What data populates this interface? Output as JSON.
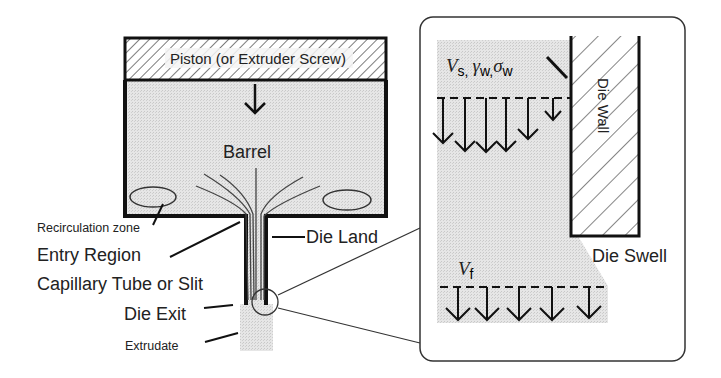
{
  "diagram": {
    "main": {
      "piston_label": "Piston (or Extruder Screw)",
      "barrel_label": "Barrel",
      "recirculation_label": "Recirculation zone",
      "entry_region_label": "Entry Region",
      "capillary_label": "Capillary Tube or Slit",
      "die_land_label": "Die Land",
      "die_exit_label": "Die Exit",
      "extrudate_label": "Extrudate"
    },
    "inset": {
      "wall_velocity_symbol": "V",
      "wall_velocity_sub": "s,",
      "shear_rate_symbol": "γ",
      "shear_rate_sub": "w",
      "separator": ",",
      "shear_stress_symbol": "σ",
      "shear_stress_sub": "w",
      "die_wall_label": "Die Wall",
      "die_swell_label": "Die Swell",
      "final_velocity_symbol": "V",
      "final_velocity_sub": "f"
    },
    "colors": {
      "fluid_fill": "#dcdcdc",
      "stroke": "#111111",
      "inset_border": "#333333"
    }
  }
}
